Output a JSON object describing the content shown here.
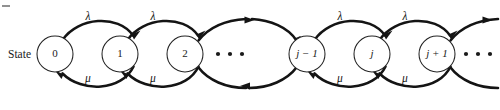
{
  "figure": {
    "kind": "state-transition-diagram",
    "width": 500,
    "height": 110,
    "background": "#ffffff",
    "ink_color": "#141414",
    "row_label": "State",
    "corner_tick_visible": true
  },
  "nodes": [
    {
      "id": "n0",
      "label": "0",
      "cx": 55,
      "cy": 54,
      "r": 18,
      "italic": false
    },
    {
      "id": "n1",
      "label": "1",
      "cx": 120,
      "cy": 54,
      "r": 18,
      "italic": false
    },
    {
      "id": "n2",
      "label": "2",
      "cx": 185,
      "cy": 54,
      "r": 18,
      "italic": false
    },
    {
      "id": "njm1",
      "label": "j − 1",
      "cx": 307,
      "cy": 54,
      "r": 18,
      "italic": true
    },
    {
      "id": "nj",
      "label": "j",
      "cx": 372,
      "cy": 54,
      "r": 18,
      "italic": true
    },
    {
      "id": "njp1",
      "label": "j + 1",
      "cx": 437,
      "cy": 54,
      "r": 18,
      "italic": true
    }
  ],
  "ellipses": [
    {
      "id": "mid-ellipsis",
      "cx": 230,
      "cy": 54,
      "dots": 3,
      "spacing": 12,
      "radius": 2.1
    },
    {
      "id": "right-ellipsis",
      "cx": 478,
      "cy": 54,
      "dots": 3,
      "spacing": 12,
      "radius": 2.1
    }
  ],
  "upper_rate_labels": [
    {
      "text": "λ",
      "x": 88,
      "y": 16
    },
    {
      "text": "λ",
      "x": 153,
      "y": 16
    },
    {
      "text": "λ",
      "x": 340,
      "y": 16
    },
    {
      "text": "λ",
      "x": 405,
      "y": 16
    }
  ],
  "lower_rate_labels": [
    {
      "text": "μ",
      "x": 88,
      "y": 79
    },
    {
      "text": "μ",
      "x": 153,
      "y": 79
    },
    {
      "text": "μ",
      "x": 340,
      "y": 79
    },
    {
      "text": "μ",
      "x": 405,
      "y": 79
    }
  ],
  "transitions": {
    "birth_rate_symbol": "λ",
    "death_rate_symbol": "μ",
    "birth_direction": "left-to-right (upper arcs)",
    "death_direction": "right-to-left (lower arcs)",
    "pairs": [
      {
        "from": "0",
        "to": "1",
        "up_rate": "λ",
        "down_rate": "μ"
      },
      {
        "from": "1",
        "to": "2",
        "up_rate": "λ",
        "down_rate": "μ"
      },
      {
        "from": "j − 1",
        "to": "j",
        "up_rate": "λ",
        "down_rate": "μ"
      },
      {
        "from": "j",
        "to": "j + 1",
        "up_rate": "λ",
        "down_rate": "μ"
      }
    ]
  },
  "edge_stubs": [
    {
      "id": "stub-from-2-up",
      "anchor_node": "n2",
      "side": "right",
      "lane": "upper",
      "has_arrowhead": true
    },
    {
      "id": "stub-into-2-down",
      "anchor_node": "n2",
      "side": "right",
      "lane": "lower",
      "has_arrowhead": false
    },
    {
      "id": "stub-into-jm1-up",
      "anchor_node": "njm1",
      "side": "left",
      "lane": "upper",
      "has_arrowhead": true
    },
    {
      "id": "stub-from-jm1-down",
      "anchor_node": "njm1",
      "side": "left",
      "lane": "lower",
      "has_arrowhead": true
    },
    {
      "id": "stub-from-jp1-up",
      "anchor_node": "njp1",
      "side": "right",
      "lane": "upper",
      "has_arrowhead": true
    },
    {
      "id": "stub-into-jp1-down",
      "anchor_node": "njp1",
      "side": "right",
      "lane": "lower",
      "has_arrowhead": false
    }
  ]
}
